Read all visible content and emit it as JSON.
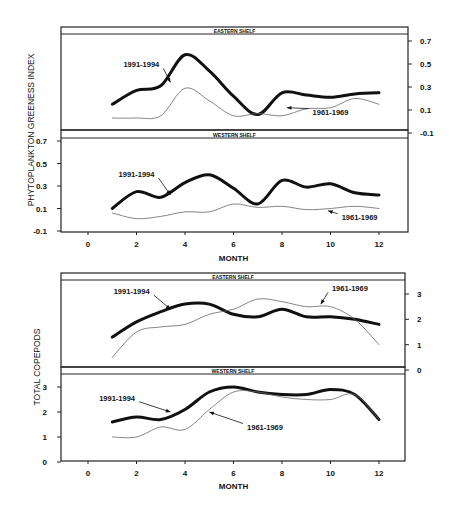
{
  "figure": {
    "top_ylabel": "PHYTOPLANKTON GREENESS INDEX",
    "bottom_ylabel": "TOTAL  COPEPODS",
    "xlabel": "MONTH"
  },
  "chart_data": [
    {
      "type": "line",
      "title": "EASTERN SHELF",
      "ylabel": "PHYTOPLANKTON GREENESS INDEX",
      "xlabel": "",
      "x": [
        1,
        2,
        3,
        4,
        5,
        6,
        7,
        8,
        9,
        10,
        11,
        12
      ],
      "xlim": [
        -1,
        13
      ],
      "ylim": [
        -0.1,
        0.75
      ],
      "yticks": [
        -0.1,
        0.1,
        0.3,
        0.5,
        0.7
      ],
      "y_axis_side": "right",
      "grid": false,
      "series": [
        {
          "name": "1991-1994",
          "style": "thick",
          "values": [
            0.15,
            0.27,
            0.31,
            0.58,
            0.44,
            0.22,
            0.06,
            0.25,
            0.23,
            0.21,
            0.24,
            0.25
          ]
        },
        {
          "name": "1961-1969",
          "style": "thin",
          "values": [
            0.03,
            0.03,
            0.05,
            0.29,
            0.18,
            0.05,
            0.07,
            0.05,
            0.11,
            0.12,
            0.2,
            0.15
          ]
        }
      ],
      "annotations": [
        {
          "text": "1991-1994",
          "x": 2.2,
          "y": 0.47,
          "arrow_to": [
            3.4,
            0.34
          ]
        },
        {
          "text": "1961-1969",
          "x": 10.0,
          "y": 0.06,
          "arrow_to": [
            8.2,
            0.12
          ]
        }
      ]
    },
    {
      "type": "line",
      "title": "WESTERN SHELF",
      "ylabel": "PHYTOPLANKTON GREENESS INDEX",
      "xlabel": "MONTH",
      "x": [
        1,
        2,
        3,
        4,
        5,
        6,
        7,
        8,
        9,
        10,
        11,
        12
      ],
      "xlim": [
        -1,
        13
      ],
      "ylim": [
        -0.1,
        0.75
      ],
      "xticks": [
        0,
        2,
        4,
        6,
        8,
        10,
        12
      ],
      "yticks": [
        -0.1,
        0.1,
        0.3,
        0.5,
        0.7
      ],
      "y_axis_side": "left",
      "grid": false,
      "series": [
        {
          "name": "1991-1994",
          "style": "thick",
          "values": [
            0.1,
            0.25,
            0.2,
            0.33,
            0.4,
            0.28,
            0.14,
            0.35,
            0.29,
            0.32,
            0.24,
            0.22
          ]
        },
        {
          "name": "1961-1969",
          "style": "thin",
          "values": [
            0.06,
            0.01,
            0.03,
            0.07,
            0.07,
            0.14,
            0.11,
            0.12,
            0.09,
            0.1,
            0.12,
            0.1
          ]
        }
      ],
      "annotations": [
        {
          "text": "1991-1994",
          "x": 2.0,
          "y": 0.38,
          "arrow_to": [
            3.4,
            0.22
          ]
        },
        {
          "text": "1961-1969",
          "x": 11.2,
          "y": 0.0,
          "arrow_to": [
            9.9,
            0.08
          ]
        }
      ]
    },
    {
      "type": "line",
      "title": "EASTERN SHELF",
      "ylabel": "TOTAL COPEPODS",
      "xlabel": "",
      "x": [
        1,
        2,
        3,
        4,
        5,
        6,
        7,
        8,
        9,
        10,
        11,
        12
      ],
      "xlim": [
        -1,
        13
      ],
      "ylim": [
        0,
        3.4
      ],
      "yticks": [
        0,
        1,
        2,
        3
      ],
      "y_axis_side": "right",
      "grid": false,
      "series": [
        {
          "name": "1991-1994",
          "style": "thick",
          "values": [
            1.3,
            1.9,
            2.3,
            2.6,
            2.6,
            2.2,
            2.1,
            2.4,
            2.1,
            2.1,
            2.0,
            1.8
          ]
        },
        {
          "name": "1961-1969",
          "style": "thin",
          "values": [
            0.5,
            1.5,
            1.7,
            1.8,
            2.2,
            2.4,
            2.8,
            2.7,
            2.5,
            2.5,
            2.0,
            1.0
          ]
        }
      ],
      "annotations": [
        {
          "text": "1991-1994",
          "x": 1.8,
          "y": 3.0,
          "arrow_to": [
            3.4,
            2.4
          ]
        },
        {
          "text": "1961-1969",
          "x": 10.8,
          "y": 3.1,
          "arrow_to": [
            9.6,
            2.6
          ]
        }
      ]
    },
    {
      "type": "line",
      "title": "WESTERN SHELF",
      "ylabel": "TOTAL COPEPODS",
      "xlabel": "MONTH",
      "x": [
        1,
        2,
        3,
        4,
        5,
        6,
        7,
        8,
        9,
        10,
        11,
        12
      ],
      "xlim": [
        -1,
        13
      ],
      "ylim": [
        0,
        3.4
      ],
      "xticks": [
        0,
        2,
        4,
        6,
        8,
        10,
        12
      ],
      "yticks": [
        0,
        1,
        2,
        3
      ],
      "y_axis_side": "left",
      "grid": false,
      "series": [
        {
          "name": "1991-1994",
          "style": "thick",
          "values": [
            1.6,
            1.8,
            1.7,
            2.1,
            2.8,
            3.0,
            2.8,
            2.7,
            2.7,
            2.9,
            2.7,
            1.7
          ]
        },
        {
          "name": "1961-1969",
          "style": "thin",
          "values": [
            1.0,
            1.0,
            1.4,
            1.3,
            2.1,
            2.8,
            2.8,
            2.6,
            2.5,
            2.5,
            2.7,
            1.7
          ]
        }
      ],
      "annotations": [
        {
          "text": "1991-1994",
          "x": 1.2,
          "y": 2.45,
          "arrow_to": [
            3.4,
            2.0
          ]
        },
        {
          "text": "1961-1969",
          "x": 7.3,
          "y": 1.3,
          "arrow_to": [
            5.0,
            2.0
          ]
        }
      ]
    }
  ]
}
